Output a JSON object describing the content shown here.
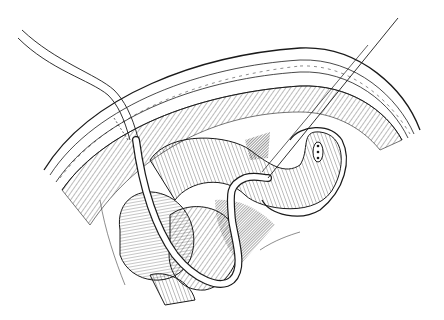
{
  "figure": {
    "kind": "surgical line illustration",
    "caption": "",
    "style": {
      "ink": "#1a1a1a",
      "background": "#ffffff"
    },
    "elements": [
      {
        "name": "abdominal-wall",
        "description": "layered abdominal wall cross-section arcing across the top"
      },
      {
        "name": "bowel-loops",
        "description": "hatched loops of small intestine below the wall"
      },
      {
        "name": "catheter-tube",
        "description": "tube entering from upper left, passing through wall and looping around bowel"
      },
      {
        "name": "needle-wire",
        "description": "thin needle/guidewire entering from upper right into bowel loop"
      },
      {
        "name": "bowel-opening",
        "description": "small stitched opening on the bowel loop at right"
      }
    ]
  }
}
